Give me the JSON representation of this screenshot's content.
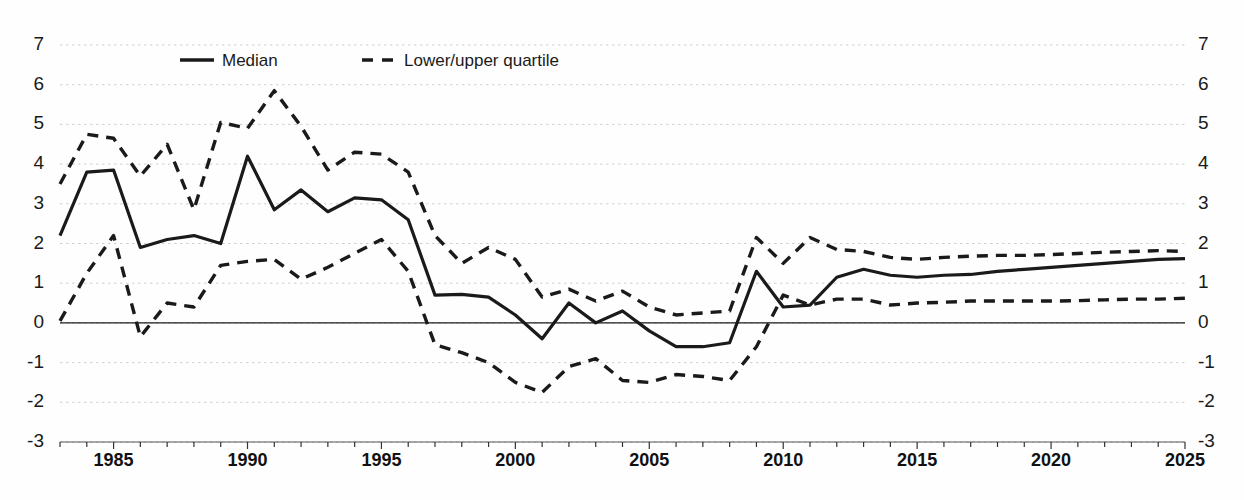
{
  "chart_data": {
    "type": "line",
    "title": "",
    "subtitle": "",
    "xlabel": "",
    "ylabel": "",
    "xlim": [
      1983,
      2025
    ],
    "ylim": [
      -3,
      7
    ],
    "grid": true,
    "grid_axis": "y",
    "legend_position": "top-center",
    "y_ticks": [
      7,
      6,
      5,
      4,
      3,
      2,
      1,
      0,
      -1,
      -2,
      -3
    ],
    "y_ticks_labels": [
      "7",
      "6",
      "5",
      "4",
      "3",
      "2",
      "1",
      "0",
      "-1",
      "-2",
      "-3"
    ],
    "y_axis_dual": true,
    "x_ticks_labeled": [
      1985,
      1990,
      1995,
      2000,
      2005,
      2010,
      2015,
      2020,
      2025
    ],
    "x_ticks_labels": [
      "1985",
      "1990",
      "1995",
      "2000",
      "2005",
      "2010",
      "2015",
      "2020",
      "2025"
    ],
    "x_tick_interval": 1,
    "x": [
      1983,
      1984,
      1985,
      1986,
      1987,
      1988,
      1989,
      1990,
      1991,
      1992,
      1993,
      1994,
      1995,
      1996,
      1997,
      1998,
      1999,
      2000,
      2001,
      2002,
      2003,
      2004,
      2005,
      2006,
      2007,
      2008,
      2009,
      2010,
      2011,
      2012,
      2013,
      2014,
      2015,
      2016,
      2017,
      2018,
      2019,
      2020,
      2021,
      2022,
      2023,
      2024,
      2025
    ],
    "series": [
      {
        "name": "Median",
        "style": "solid",
        "color": "#1a1a1a",
        "values": [
          2.2,
          3.8,
          3.85,
          1.9,
          2.1,
          2.2,
          2.0,
          4.2,
          2.85,
          3.35,
          2.8,
          3.15,
          3.1,
          2.6,
          0.7,
          0.72,
          0.65,
          0.2,
          -0.4,
          0.5,
          0.0,
          0.3,
          -0.2,
          -0.6,
          -0.6,
          -0.5,
          1.3,
          0.4,
          0.45,
          1.15,
          1.35,
          1.2,
          1.15,
          1.2,
          1.22,
          1.3,
          1.35,
          1.4,
          1.45,
          1.5,
          1.55,
          1.6,
          1.62
        ]
      },
      {
        "name": "Lower/upper quartile",
        "style": "dashed",
        "color": "#1a1a1a",
        "sublabel": "upper",
        "values": [
          3.5,
          4.75,
          4.65,
          3.7,
          4.5,
          2.85,
          5.05,
          4.9,
          5.85,
          4.95,
          3.85,
          4.3,
          4.25,
          3.8,
          2.2,
          1.5,
          1.9,
          1.6,
          0.65,
          0.85,
          0.55,
          0.8,
          0.4,
          0.2,
          0.25,
          0.3,
          2.15,
          1.5,
          2.15,
          1.85,
          1.8,
          1.65,
          1.6,
          1.65,
          1.68,
          1.7,
          1.7,
          1.72,
          1.75,
          1.78,
          1.8,
          1.82,
          1.8
        ]
      },
      {
        "name": "Lower/upper quartile",
        "style": "dashed",
        "color": "#1a1a1a",
        "sublabel": "lower",
        "values": [
          0.05,
          1.25,
          2.2,
          -0.35,
          0.5,
          0.4,
          1.45,
          1.55,
          1.6,
          1.1,
          1.4,
          1.75,
          2.1,
          1.3,
          -0.55,
          -0.75,
          -1.0,
          -1.5,
          -1.75,
          -1.1,
          -0.9,
          -1.45,
          -1.5,
          -1.3,
          -1.35,
          -1.45,
          -0.6,
          0.7,
          0.45,
          0.6,
          0.6,
          0.45,
          0.5,
          0.52,
          0.55,
          0.55,
          0.55,
          0.55,
          0.56,
          0.58,
          0.6,
          0.6,
          0.62
        ]
      }
    ],
    "legend": [
      {
        "label": "Median",
        "style": "solid"
      },
      {
        "label": "Lower/upper quartile",
        "style": "dashed"
      }
    ],
    "zero_line": true
  }
}
